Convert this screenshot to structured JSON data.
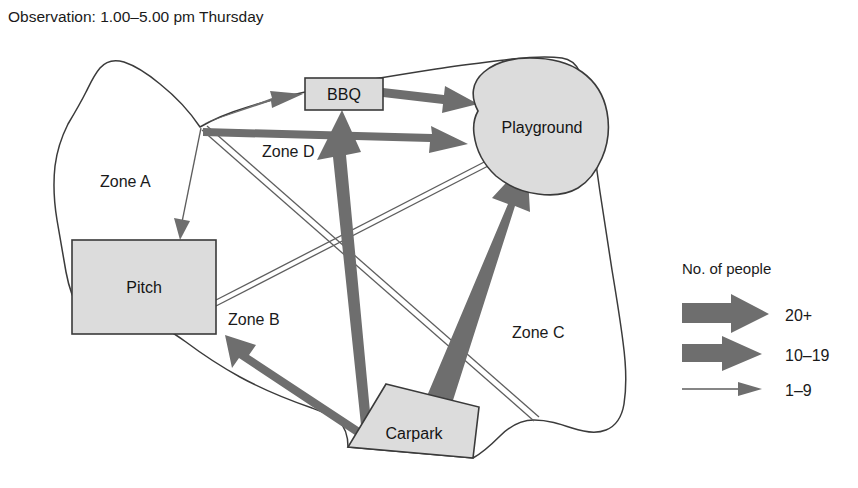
{
  "figure": {
    "title": "Observation: 1.00–5.00 pm Thursday"
  },
  "places": [
    {
      "id": "bbq",
      "label": "BBQ"
    },
    {
      "id": "playground",
      "label": "Playground"
    },
    {
      "id": "pitch",
      "label": "Pitch"
    },
    {
      "id": "carpark",
      "label": "Carpark"
    }
  ],
  "zones": [
    {
      "id": "zone-a",
      "label": "Zone A"
    },
    {
      "id": "zone-b",
      "label": "Zone B"
    },
    {
      "id": "zone-c",
      "label": "Zone C"
    },
    {
      "id": "zone-d",
      "label": "Zone D"
    }
  ],
  "legend": {
    "title": "No. of people",
    "items": [
      {
        "id": "heavy",
        "label": "20+",
        "weight": "heavy"
      },
      {
        "id": "medium",
        "label": "10–19",
        "weight": "medium"
      },
      {
        "id": "thin",
        "label": "1–9",
        "weight": "thin"
      }
    ]
  },
  "flows": [
    {
      "id": "entrance-to-bbq",
      "from": "entrance",
      "to": "bbq",
      "band": "10–19"
    },
    {
      "id": "entrance-to-playground",
      "from": "entrance",
      "to": "playground",
      "band": "10–19"
    },
    {
      "id": "bbq-to-playground",
      "from": "bbq",
      "to": "playground",
      "band": "10–19"
    },
    {
      "id": "entrance-to-pitch",
      "from": "entrance",
      "to": "pitch",
      "band": "1–9"
    },
    {
      "id": "entrance-to-carpark",
      "from": "entrance",
      "to": "carpark",
      "band": "1–9"
    },
    {
      "id": "pitch-to-playground",
      "from": "pitch",
      "to": "playground",
      "band": "1–9"
    },
    {
      "id": "carpark-to-bbq",
      "from": "carpark",
      "to": "bbq",
      "band": "20+"
    },
    {
      "id": "carpark-to-playground",
      "from": "carpark",
      "to": "playground",
      "band": "20+"
    },
    {
      "id": "carpark-to-pitch",
      "from": "carpark",
      "to": "pitch",
      "band": "10–19"
    }
  ],
  "colors": {
    "flow": "#6e6e6e",
    "place_fill": "#dcdcdc",
    "boundary": "#3b3b3b",
    "text": "#1a1a1a",
    "background": "#ffffff"
  }
}
